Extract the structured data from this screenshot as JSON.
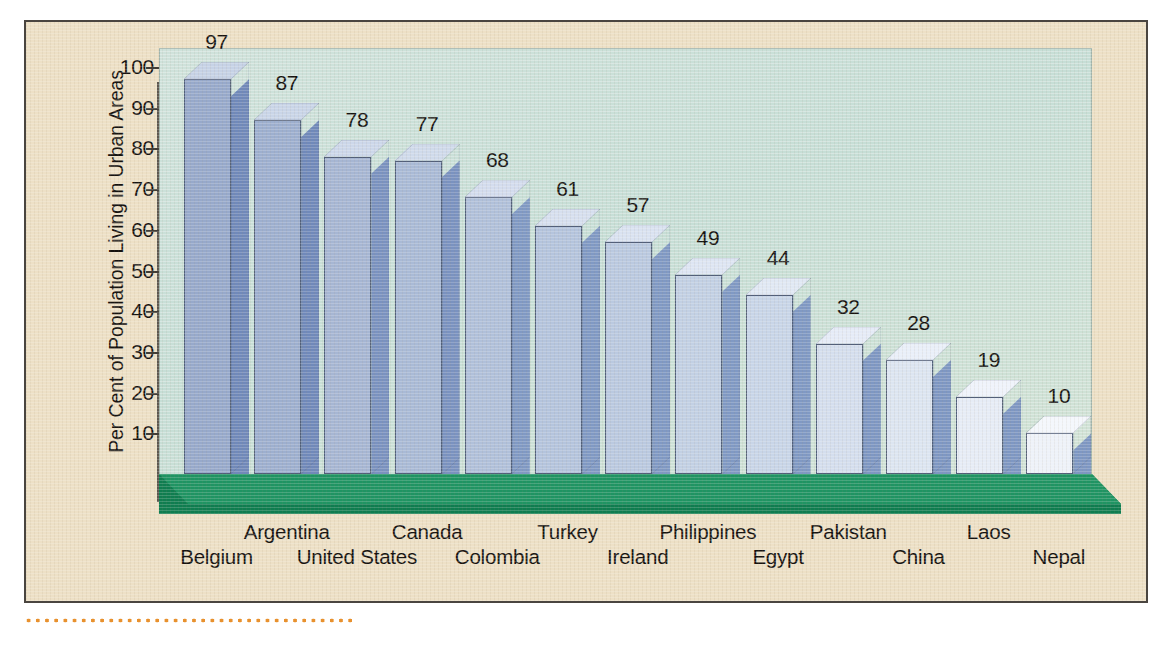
{
  "chart_data": {
    "type": "bar",
    "title": "",
    "subtitle": "",
    "xlabel": "",
    "ylabel": "Per Cent of Population Living in Urban Areas",
    "ylim": [
      0,
      100
    ],
    "ytick_values": [
      100,
      90,
      80,
      70,
      60,
      50,
      40,
      30,
      20,
      10
    ],
    "ytick_labels": [
      "100",
      "90",
      "80",
      "70",
      "60",
      "50",
      "40",
      "30",
      "20",
      "10"
    ],
    "grid": false,
    "legend": null,
    "style": "3d-bar",
    "categories": [
      "Belgium",
      "Argentina",
      "United States",
      "Canada",
      "Colombia",
      "Turkey",
      "Ireland",
      "Philippines",
      "Egypt",
      "Pakistan",
      "China",
      "Laos",
      "Nepal"
    ],
    "values": [
      97,
      87,
      78,
      77,
      68,
      61,
      57,
      49,
      44,
      32,
      28,
      19,
      10
    ],
    "value_labels": [
      "97",
      "87",
      "78",
      "77",
      "68",
      "61",
      "57",
      "49",
      "44",
      "32",
      "28",
      "19",
      "10"
    ],
    "bar_label_rows": [
      1,
      0,
      1,
      0,
      1,
      0,
      1,
      0,
      1,
      0,
      1,
      0,
      1
    ],
    "bar_face_colors": [
      "#97a9cb",
      "#9dafcf",
      "#a6b6d3",
      "#a9bad6",
      "#b0c0da",
      "#b4c4dd",
      "#bac9e0",
      "#c2d0e4",
      "#c8d5e8",
      "#d4deee",
      "#dce5f1",
      "#e6ecf6",
      "#eef2f9"
    ],
    "bar_side_colors": [
      "#7089ba",
      "#7089ba",
      "#7a92c0",
      "#7a92c0",
      "#8099c4",
      "#8099c4",
      "#8099c4",
      "#8099c4",
      "#8099c4",
      "#7e97c3",
      "#7e97c3",
      "#7e97c3",
      "#7e97c3"
    ],
    "bar_top_colors": [
      "#c6d2e6",
      "#c9d5e8",
      "#ccd7ea",
      "#cfdaeb",
      "#d3dcee",
      "#d6dfef",
      "#d9e2f1",
      "#dde5f3",
      "#e0e8f4",
      "#e5ebf7",
      "#e9eff9",
      "#eff3fb",
      "#f4f7fc"
    ]
  },
  "colors": {
    "card_background": "#ede0c6",
    "card_border": "#4a4540",
    "plot_background": "#cadfd7",
    "floor_top": "#1f9463",
    "floor_front": "#0f7d50",
    "axis": "#5b564f",
    "text": "#15120f",
    "dotted_rule": "#e8912e"
  },
  "icons": {
    "dotted_rule": "dotted-rule-decoration"
  }
}
